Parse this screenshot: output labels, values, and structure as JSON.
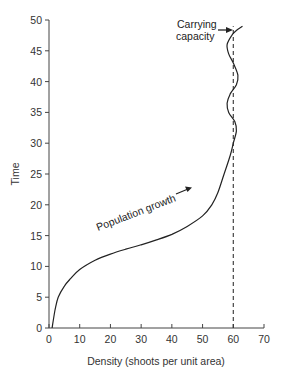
{
  "chart_data": {
    "type": "line",
    "title": "",
    "xlabel": "Density (shoots per unit area)",
    "ylabel": "Time",
    "xlim": [
      0,
      70
    ],
    "ylim": [
      0,
      50
    ],
    "x_ticks": [
      0,
      10,
      20,
      30,
      40,
      50,
      60,
      70
    ],
    "y_ticks": [
      0,
      5,
      10,
      15,
      20,
      25,
      30,
      35,
      40,
      45,
      50
    ],
    "grid": false,
    "legend": null,
    "series": [
      {
        "name": "Population growth",
        "style": "solid",
        "points": [
          [
            1,
            0
          ],
          [
            2,
            3
          ],
          [
            3,
            5
          ],
          [
            5,
            6.8
          ],
          [
            7,
            8
          ],
          [
            10,
            9.5
          ],
          [
            15,
            11
          ],
          [
            20,
            12
          ],
          [
            25,
            12.8
          ],
          [
            30,
            13.5
          ],
          [
            35,
            14.3
          ],
          [
            40,
            15.2
          ],
          [
            45,
            16.5
          ],
          [
            50,
            18.2
          ],
          [
            53,
            20
          ],
          [
            55,
            22
          ],
          [
            57,
            25
          ],
          [
            59,
            28
          ],
          [
            60,
            30
          ],
          [
            61,
            32
          ],
          [
            60.5,
            33.5
          ],
          [
            58.5,
            35
          ],
          [
            58,
            36.5
          ],
          [
            59,
            38
          ],
          [
            61,
            39.5
          ],
          [
            61.5,
            41
          ],
          [
            60,
            43
          ],
          [
            58.5,
            44.5
          ],
          [
            58,
            46
          ],
          [
            59.5,
            47.5
          ],
          [
            61,
            48.3
          ],
          [
            63,
            49
          ]
        ]
      },
      {
        "name": "Carrying capacity",
        "style": "dashed",
        "points": [
          [
            60,
            0
          ],
          [
            60,
            49
          ]
        ]
      }
    ],
    "annotations": [
      {
        "text": "Population growth",
        "x": 30,
        "y": 15,
        "rotation": -22,
        "arrow": true
      },
      {
        "text_lines": [
          "Carrying",
          "capacity"
        ],
        "x": 48,
        "y": 48,
        "arrow_to": [
          60,
          48.5
        ]
      }
    ]
  },
  "axes": {
    "x_title": "Density (shoots per unit area)",
    "y_title": "Time",
    "x_tick_labels": [
      "0",
      "10",
      "20",
      "30",
      "40",
      "50",
      "60",
      "70"
    ],
    "y_tick_labels": [
      "0",
      "5",
      "10",
      "15",
      "20",
      "25",
      "30",
      "35",
      "40",
      "45",
      "50"
    ]
  },
  "annotations": {
    "growth_label": "Population growth",
    "capacity_line1": "Carrying",
    "capacity_line2": "capacity"
  },
  "colors": {
    "line": "#222222",
    "axis": "#444444",
    "background": "#ffffff"
  }
}
